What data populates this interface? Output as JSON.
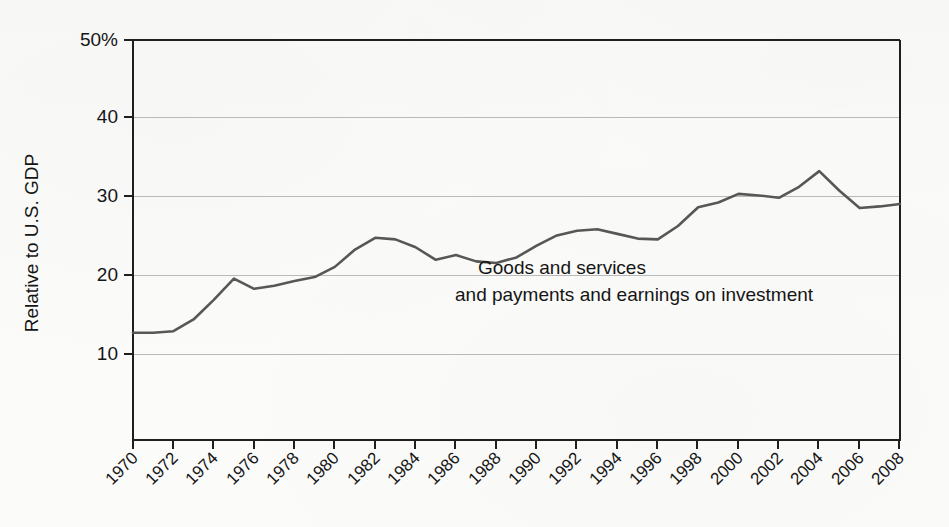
{
  "chart_data": {
    "type": "line",
    "title": "",
    "subtitle": "",
    "xlabel": "",
    "ylabel": "Relative to U.S. GDP",
    "ylim": [
      0,
      50
    ],
    "xlim": [
      1970,
      2008
    ],
    "grid": "horizontal",
    "legend_position": "inline-annotation",
    "y_tick_labels": [
      "50%",
      "40",
      "30",
      "20",
      "10"
    ],
    "y_tick_values": [
      50,
      40,
      30,
      20,
      10
    ],
    "x_tick_labels": [
      "1970",
      "1972",
      "1974",
      "1976",
      "1978",
      "1980",
      "1982",
      "1984",
      "1986",
      "1988",
      "1990",
      "1992",
      "1994",
      "1996",
      "1998",
      "2000",
      "2002",
      "2004",
      "2006",
      "2008"
    ],
    "x_tick_values": [
      1970,
      1972,
      1974,
      1976,
      1978,
      1980,
      1982,
      1984,
      1986,
      1988,
      1990,
      1992,
      1994,
      1996,
      1998,
      2000,
      2002,
      2004,
      2006,
      2008
    ],
    "annotations": [
      {
        "line1": "Goods and services",
        "line2": "and payments and earnings on investment"
      }
    ],
    "series": [
      {
        "name": "Goods and services and payments and earnings on investment",
        "color": "#575757",
        "x": [
          1970,
          1971,
          1972,
          1973,
          1974,
          1975,
          1976,
          1977,
          1978,
          1979,
          1980,
          1981,
          1982,
          1983,
          1984,
          1985,
          1986,
          1987,
          1988,
          1989,
          1990,
          1991,
          1992,
          1993,
          1994,
          1995,
          1996,
          1997,
          1998,
          1999,
          2000,
          2001,
          2002,
          2003,
          2004,
          2005,
          2006,
          2007,
          2008
        ],
        "values": [
          12.7,
          12.7,
          12.9,
          14.4,
          16.9,
          19.6,
          18.3,
          18.7,
          19.3,
          19.8,
          21.1,
          23.3,
          24.8,
          24.6,
          23.6,
          22.0,
          22.6,
          21.8,
          21.6,
          22.3,
          23.8,
          25.1,
          25.7,
          25.9,
          25.3,
          24.7,
          24.6,
          26.3,
          28.7,
          29.3,
          30.4,
          30.2,
          29.9,
          31.3,
          33.3,
          30.8,
          28.6,
          28.8,
          29.1
        ]
      }
    ],
    "series_2004_2008": [
      33.3,
      30.8,
      28.6,
      28.8,
      31.0
    ]
  },
  "chart_points": {
    "note": "Values read from the plotted curve",
    "years": [
      1970,
      1971,
      1972,
      1973,
      1974,
      1975,
      1976,
      1977,
      1978,
      1979,
      1980,
      1981,
      1982,
      1983,
      1984,
      1985,
      1986,
      1987,
      1988,
      1989,
      1990,
      1991,
      1992,
      1993,
      1994,
      1995,
      1996,
      1997,
      1998,
      1999,
      2000,
      2001,
      2002,
      2003,
      2004,
      2005,
      2006,
      2007,
      2008
    ],
    "percent_of_gdp": [
      12.7,
      12.7,
      12.9,
      14.4,
      16.9,
      19.6,
      18.3,
      18.7,
      19.3,
      19.8,
      21.1,
      23.3,
      24.8,
      24.6,
      23.6,
      22.0,
      22.6,
      21.8,
      21.6,
      22.3,
      23.8,
      25.1,
      25.7,
      25.9,
      25.3,
      24.7,
      24.6,
      26.3,
      28.7,
      29.3,
      30.4,
      30.2,
      29.9,
      31.3,
      33.3,
      30.8,
      28.6,
      28.8,
      31.0
    ]
  },
  "axes": {
    "y_label": "Relative to U.S. GDP",
    "y_ticks": [
      "50%",
      "40",
      "30",
      "20",
      "10"
    ],
    "x_ticks": [
      "1970",
      "1972",
      "1974",
      "1976",
      "1978",
      "1980",
      "1982",
      "1984",
      "1986",
      "1988",
      "1990",
      "1992",
      "1994",
      "1996",
      "1998",
      "2000",
      "2002",
      "2004",
      "2006",
      "2008"
    ]
  },
  "annotation": {
    "line1": "Goods and services",
    "line2": "and payments and earnings on investment"
  },
  "colors": {
    "line": "#575757",
    "gridline": "#b9b9b9",
    "axis": "#1f1f1f",
    "background": "#fbfbfa",
    "text": "#151515"
  }
}
